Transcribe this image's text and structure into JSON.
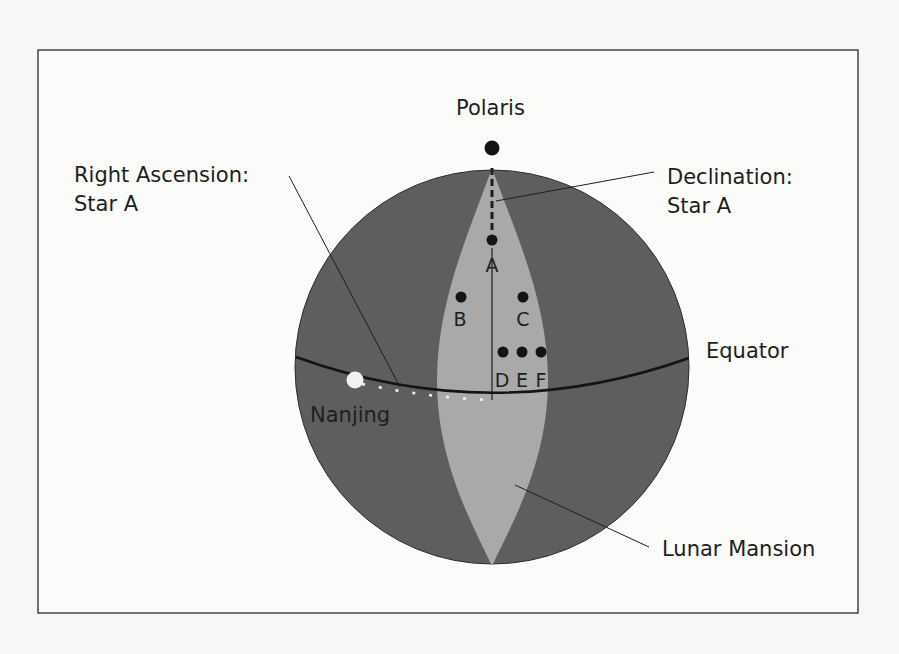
{
  "figure": {
    "labels": {
      "polaris": "Polaris",
      "right_ascension_line1": "Right Ascension:",
      "right_ascension_line2": "Star A",
      "declination_line1": "Declination:",
      "declination_line2": "Star A",
      "equator": "Equator",
      "nanjing": "Nanjing",
      "lunar_mansion": "Lunar Mansion"
    },
    "stars": [
      {
        "id": "A",
        "label": "A"
      },
      {
        "id": "B",
        "label": "B"
      },
      {
        "id": "C",
        "label": "C"
      },
      {
        "id": "D",
        "label": "D"
      },
      {
        "id": "E",
        "label": "E"
      },
      {
        "id": "F",
        "label": "F"
      }
    ],
    "colors": {
      "background": "#f7f7f5",
      "sphere": "#5e5e5e",
      "lunar_mansion": "#a9a9a9",
      "lines": "#1e1e1e",
      "nanjing_dot": "#f2f2f2"
    }
  }
}
